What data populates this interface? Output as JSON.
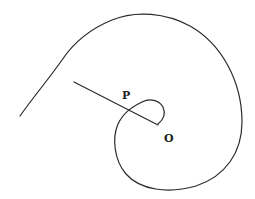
{
  "diagram": {
    "type": "spiral",
    "labels": {
      "P": "P",
      "O": "O"
    },
    "colors": {
      "stroke": "#2a2a2a",
      "background": "#ffffff"
    }
  }
}
